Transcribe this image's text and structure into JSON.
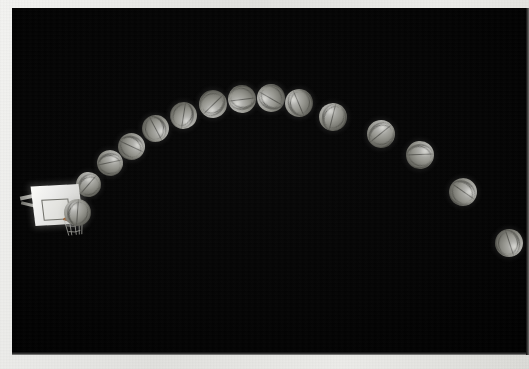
{
  "photo": {
    "title": "Stroboscopic multiple-exposure photograph of a basketball shot",
    "subject": "basketball-free-throw-trajectory",
    "background_color": "#000000",
    "border_color": "#ededea",
    "exposure": {
      "x": 12,
      "y": 8,
      "width": 516,
      "height": 347
    }
  },
  "hoop": {
    "name": "basketball-hoop",
    "backboard_color": "#f1f1ee",
    "rim_color": "#8d4f22",
    "net_color": "#b9b9b4",
    "position": {
      "x": 8,
      "y": 165
    }
  },
  "chart_data": {
    "type": "scatter",
    "xlabel": "horizontal position (px)",
    "ylabel": "vertical position (px, screen coords)",
    "xlim": [
      12,
      528
    ],
    "ylim": [
      355,
      8
    ],
    "grid": false,
    "legend": null,
    "series": [
      {
        "name": "basketball-strobe-positions",
        "marker": "basketball",
        "marker_color": "#96968f",
        "x": [
          66,
          88,
          110,
          131,
          155,
          183,
          213,
          242,
          271,
          299,
          333,
          381,
          420,
          463,
          509
        ],
        "y": [
          205,
          184,
          163,
          146,
          128,
          115,
          104,
          99,
          98,
          103,
          117,
          134,
          155,
          192,
          243
        ],
        "diameters": [
          27,
          25,
          26,
          27,
          27,
          27,
          28,
          28,
          28,
          28,
          28,
          28,
          28,
          28,
          28
        ]
      }
    ],
    "annotations": [
      {
        "label": "basketball-hoop",
        "x": 45,
        "y": 205
      }
    ]
  },
  "balls": [
    {
      "name": "ball-1",
      "x": 52,
      "y": 191,
      "d": 27
    },
    {
      "name": "ball-2",
      "x": 75,
      "y": 171,
      "d": 25
    },
    {
      "name": "ball-3",
      "x": 97,
      "y": 150,
      "d": 26
    },
    {
      "name": "ball-4",
      "x": 117,
      "y": 132,
      "d": 27
    },
    {
      "name": "ball-5",
      "x": 141,
      "y": 114,
      "d": 27
    },
    {
      "name": "ball-6",
      "x": 169,
      "y": 101,
      "d": 27
    },
    {
      "name": "ball-7",
      "x": 199,
      "y": 90,
      "d": 28
    },
    {
      "name": "ball-8",
      "x": 228,
      "y": 85,
      "d": 28
    },
    {
      "name": "ball-9",
      "x": 257,
      "y": 84,
      "d": 28
    },
    {
      "name": "ball-10",
      "x": 285,
      "y": 89,
      "d": 28
    },
    {
      "name": "ball-11",
      "x": 319,
      "y": 103,
      "d": 28
    },
    {
      "name": "ball-12",
      "x": 367,
      "y": 120,
      "d": 28
    },
    {
      "name": "ball-13",
      "x": 406,
      "y": 141,
      "d": 28
    },
    {
      "name": "ball-14",
      "x": 449,
      "y": 178,
      "d": 28
    },
    {
      "name": "ball-15",
      "x": 495,
      "y": 229,
      "d": 28
    }
  ]
}
